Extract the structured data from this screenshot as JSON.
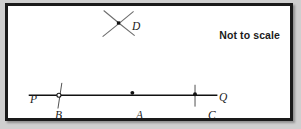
{
  "figure": {
    "annotation": "Not to scale",
    "background_color": "#ffffff",
    "outer_background_color": "#cfcfcf",
    "border_color": "#1a1a1a",
    "ink_color": "#1b1b1b",
    "line_color": "#111111"
  },
  "labels": {
    "P": "P",
    "B": "B",
    "A": "A",
    "C": "C",
    "Q": "Q",
    "D": "D"
  },
  "geometry": {
    "type": "line-with-points",
    "main_line": {
      "name": "PQ",
      "x1": 27,
      "y1": 99,
      "x2": 218,
      "y2": 99
    },
    "points": [
      {
        "id": "B",
        "x": 57,
        "y": 99,
        "marker": "open-circle"
      },
      {
        "id": "A",
        "x": 132,
        "y": 97,
        "marker": "filled-dot"
      },
      {
        "id": "C",
        "x": 196,
        "y": 99,
        "marker": "filled-dot"
      },
      {
        "id": "D",
        "x": 120,
        "y": 22,
        "marker": "filled-square"
      }
    ],
    "tick_marks": [
      {
        "through": "B",
        "x1": 60,
        "y1": 86,
        "x2": 56,
        "y2": 112
      },
      {
        "through": "C",
        "x1": 196,
        "y1": 88,
        "x2": 196,
        "y2": 110
      }
    ],
    "construction_arcs": [
      {
        "name": "arc-upper-left-to-lower-right",
        "x1": 105,
        "y1": 10,
        "x2": 134,
        "y2": 34
      },
      {
        "name": "arc-lower-left-to-upper-right",
        "x1": 104,
        "y1": 35,
        "x2": 133,
        "y2": 11
      }
    ]
  }
}
